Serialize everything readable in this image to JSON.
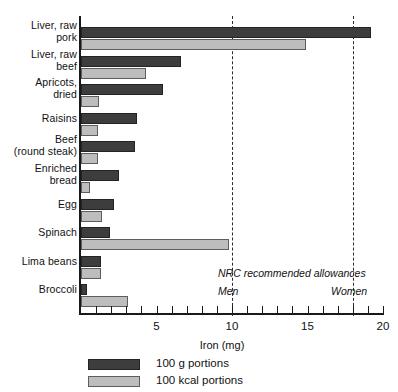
{
  "chart_data": {
    "type": "bar",
    "orientation": "horizontal",
    "title": "",
    "xlabel": "Iron (mg)",
    "ylabel": "",
    "xlim": [
      0,
      20
    ],
    "xticks": [
      5,
      10,
      15,
      20
    ],
    "xtick_labels": [
      "5",
      "10",
      "15",
      "20"
    ],
    "grid": false,
    "legend_position": "bottom-left",
    "categories": [
      "Liver, raw\npork",
      "Liver, raw\nbeef",
      "Apricots,\ndried",
      "Raisins",
      "Beef\n(round steak)",
      "Enriched\nbread",
      "Egg",
      "Spinach",
      "Lima beans",
      "Broccoli"
    ],
    "series": [
      {
        "name": "100 g portions",
        "color": "#3d3d3d",
        "values": [
          19.2,
          6.6,
          5.4,
          3.7,
          3.6,
          2.5,
          2.2,
          1.9,
          1.3,
          0.4
        ]
      },
      {
        "name": "100 kcal portions",
        "color": "#bdbdbd",
        "values": [
          14.9,
          4.3,
          1.2,
          1.1,
          1.1,
          0.6,
          1.4,
          9.8,
          1.3,
          3.1
        ]
      }
    ],
    "reference_lines": [
      {
        "label": "Men",
        "value": 10
      },
      {
        "label": "Women",
        "value": 18
      }
    ],
    "annotations": {
      "nrc_title": "NRC recommended allowances"
    }
  },
  "categories_display": [
    {
      "line1": "Liver, raw",
      "line2": "pork"
    },
    {
      "line1": "Liver, raw",
      "line2": "beef"
    },
    {
      "line1": "Apricots,",
      "line2": "dried"
    },
    {
      "line1": "Raisins",
      "line2": ""
    },
    {
      "line1": "Beef",
      "line2": "(round steak)"
    },
    {
      "line1": "Enriched",
      "line2": "bread"
    },
    {
      "line1": "Egg",
      "line2": ""
    },
    {
      "line1": "Spinach",
      "line2": ""
    },
    {
      "line1": "Lima beans",
      "line2": ""
    },
    {
      "line1": "Broccoli",
      "line2": ""
    }
  ],
  "legend": [
    {
      "label": "100 g portions",
      "key": "g100"
    },
    {
      "label": "100 kcal portions",
      "key": "kcal100"
    }
  ],
  "axis": {
    "x_title": "Iron (mg)",
    "ticks": [
      "5",
      "10",
      "15",
      "20"
    ]
  },
  "nrc": {
    "title": "NRC recommended allowances",
    "men": "Men",
    "women": "Women"
  },
  "colors": {
    "bar_dark": "#3d3d3d",
    "bar_light": "#bdbdbd",
    "axis": "#1a1a1a",
    "background": "#ffffff"
  }
}
